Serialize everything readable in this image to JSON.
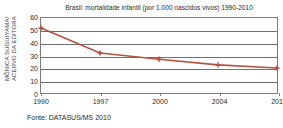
{
  "credit": {
    "line1": "MÔNICA SUGUIYAMA/",
    "line2": "ACERVO DA EDITORA"
  },
  "source_note": "Fonte: DATASUS/MS 2010",
  "style": {
    "series_color": "#b5523f",
    "axis_color": "#7d7d7d",
    "grid_color": "#6f6f6f"
  },
  "chart_data": {
    "type": "line",
    "title": "Brasil: mortalidade infantil (por 1.000 nascidos vivos) 1990-2010",
    "xlabel": "",
    "ylabel": "",
    "categories": [
      "1990",
      "1997",
      "2000",
      "2004",
      "2010"
    ],
    "values": [
      52,
      32,
      27,
      22.5,
      20
    ],
    "ylim": [
      0,
      60
    ],
    "yticks": [
      0,
      10,
      20,
      30,
      40,
      50,
      60
    ],
    "ytick_labels": [
      "0",
      "10",
      "20",
      "30",
      "40",
      "50",
      "60"
    ],
    "grid": true,
    "legend": false,
    "marker": "diamond",
    "series": [
      {
        "name": "mortalidade infantil",
        "values": [
          52,
          32,
          27,
          22.5,
          20
        ]
      }
    ]
  }
}
